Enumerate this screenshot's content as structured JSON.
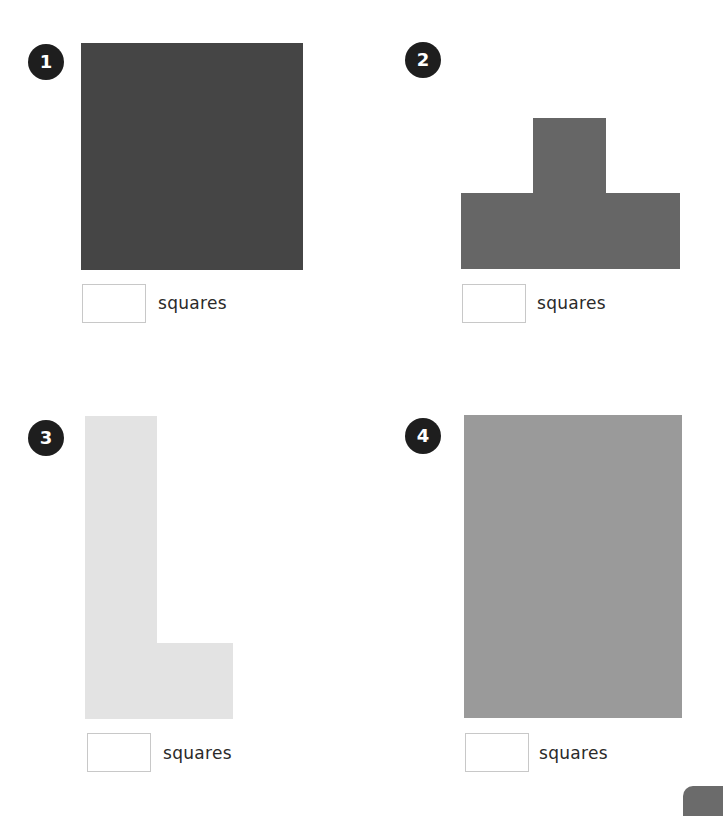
{
  "exercises": [
    {
      "number": "1",
      "shape": "square-3x3",
      "color": "#454545",
      "answer_value": "",
      "unit_label": "squares"
    },
    {
      "number": "2",
      "shape": "t-shape",
      "color": "#666666",
      "answer_value": "",
      "unit_label": "squares"
    },
    {
      "number": "3",
      "shape": "l-shape",
      "color": "#e3e3e3",
      "answer_value": "",
      "unit_label": "squares"
    },
    {
      "number": "4",
      "shape": "rectangle-3x4",
      "color": "#9a9a9a",
      "answer_value": "",
      "unit_label": "squares"
    }
  ],
  "colors": {
    "badge": "#1e1e1e",
    "box_border": "#c8c8c8",
    "page_tab": "#6b6b6b"
  }
}
